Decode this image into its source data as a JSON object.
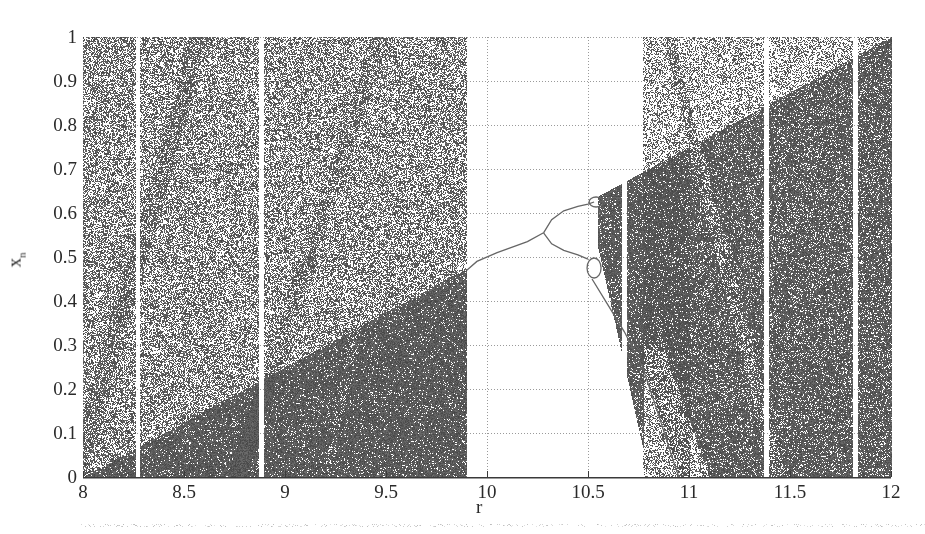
{
  "chart_data": {
    "type": "scatter",
    "title": "",
    "xlabel": "r",
    "ylabel": "x_n",
    "xlim": [
      8,
      12
    ],
    "ylim": [
      0,
      1
    ],
    "grid": true,
    "grid_style": "dotted",
    "xticks": [
      "8",
      "8.5",
      "9",
      "9.5",
      "10",
      "10.5",
      "11",
      "11.5",
      "12"
    ],
    "xtick_values": [
      8,
      8.5,
      9,
      9.5,
      10,
      10.5,
      11,
      11.5,
      12
    ],
    "yticks": [
      "0",
      "0.1",
      "0.2",
      "0.3",
      "0.4",
      "0.5",
      "0.6",
      "0.7",
      "0.8",
      "0.9",
      "1"
    ],
    "ytick_values": [
      0,
      0.1,
      0.2,
      0.3,
      0.4,
      0.5,
      0.6,
      0.7,
      0.8,
      0.9,
      1
    ],
    "band_boundary_line": {
      "from": [
        8,
        0
      ],
      "to": [
        12,
        1
      ],
      "equation": "x = (r - 8) / 4"
    },
    "chaotic_regions": [
      {
        "r_start": 8.0,
        "r_end": 9.9,
        "y_range": [
          0,
          1
        ]
      },
      {
        "r_start": 10.77,
        "r_end": 12.0,
        "y_range": [
          0,
          1
        ]
      }
    ],
    "periodic_window_gaps": [
      8.27,
      8.88,
      10.68,
      11.38,
      11.82
    ],
    "periodic_window": {
      "r_start": 9.9,
      "r_end": 10.77,
      "bifurcation_points": [
        {
          "r": 10.28,
          "x": 0.555,
          "label": "period-2 bifurcation"
        },
        {
          "r": 10.52,
          "x": 0.62,
          "label": "period-4 upper"
        },
        {
          "r": 10.52,
          "x": 0.49,
          "label": "period-4 lower"
        }
      ],
      "period1_curve": [
        [
          9.9,
          0.47
        ],
        [
          10.0,
          0.5
        ],
        [
          10.15,
          0.525
        ],
        [
          10.28,
          0.555
        ]
      ],
      "upper_branch": [
        [
          10.28,
          0.555
        ],
        [
          10.35,
          0.59
        ],
        [
          10.45,
          0.615
        ],
        [
          10.52,
          0.62
        ],
        [
          10.6,
          0.635
        ]
      ],
      "lower_branch": [
        [
          10.28,
          0.555
        ],
        [
          10.35,
          0.52
        ],
        [
          10.45,
          0.5
        ],
        [
          10.52,
          0.49
        ],
        [
          10.6,
          0.41
        ],
        [
          10.7,
          0.33
        ],
        [
          10.77,
          0.25
        ],
        [
          10.85,
          0.1
        ],
        [
          10.92,
          0.0
        ]
      ]
    }
  },
  "colors": {
    "dense": "#555555",
    "background": "#ffffff",
    "text": "#2a2a2a",
    "axis": "#3a3a3a",
    "grid": "#9a9a9a"
  }
}
